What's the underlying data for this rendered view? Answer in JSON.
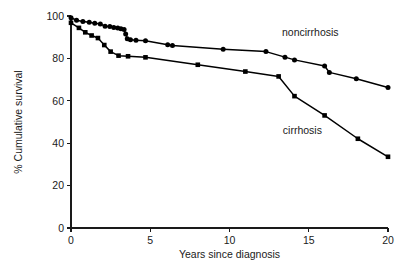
{
  "chart_data": {
    "type": "line",
    "title": "",
    "xlabel": "Years since diagnosis",
    "ylabel": "% Cumulative survival",
    "xlim": [
      0,
      20
    ],
    "ylim": [
      0,
      100
    ],
    "xticks": [
      0,
      5,
      10,
      15,
      20
    ],
    "yticks": [
      0,
      20,
      40,
      60,
      80,
      100
    ],
    "xtick_labels": [
      "0",
      "5",
      "10",
      "15",
      "20"
    ],
    "ytick_labels": [
      "0",
      "20",
      "40",
      "60",
      "80",
      "100"
    ],
    "grid": false,
    "legend_position": "inline-annotations",
    "series": [
      {
        "name": "noncirrhosis",
        "marker": "circle",
        "color": "#000000",
        "label_text": "noncirrhosis",
        "label_x": 15.1,
        "label_y": 90.5,
        "points": [
          {
            "x": 0.0,
            "y": 99.2
          },
          {
            "x": 0.35,
            "y": 98.0
          },
          {
            "x": 0.75,
            "y": 97.4
          },
          {
            "x": 1.15,
            "y": 97.0
          },
          {
            "x": 1.5,
            "y": 96.6
          },
          {
            "x": 1.85,
            "y": 96.2
          },
          {
            "x": 2.15,
            "y": 95.2
          },
          {
            "x": 2.45,
            "y": 95.0
          },
          {
            "x": 2.7,
            "y": 94.6
          },
          {
            "x": 2.95,
            "y": 94.3
          },
          {
            "x": 3.15,
            "y": 94.0
          },
          {
            "x": 3.35,
            "y": 93.6
          },
          {
            "x": 3.45,
            "y": 91.5
          },
          {
            "x": 3.55,
            "y": 89.3
          },
          {
            "x": 3.75,
            "y": 88.8
          },
          {
            "x": 4.1,
            "y": 88.6
          },
          {
            "x": 4.7,
            "y": 88.3
          },
          {
            "x": 6.1,
            "y": 86.4
          },
          {
            "x": 6.4,
            "y": 86.1
          },
          {
            "x": 9.6,
            "y": 84.3
          },
          {
            "x": 12.3,
            "y": 83.2
          },
          {
            "x": 13.5,
            "y": 80.6
          },
          {
            "x": 14.1,
            "y": 79.3
          },
          {
            "x": 16.0,
            "y": 76.4
          },
          {
            "x": 16.3,
            "y": 73.4
          },
          {
            "x": 18.0,
            "y": 70.4
          },
          {
            "x": 20.0,
            "y": 66.3
          }
        ]
      },
      {
        "name": "cirrhosis",
        "marker": "square",
        "color": "#000000",
        "label_text": "cirrhosis",
        "label_x": 14.6,
        "label_y": 44.5,
        "points": [
          {
            "x": 0.0,
            "y": 96.8
          },
          {
            "x": 0.5,
            "y": 94.4
          },
          {
            "x": 0.9,
            "y": 92.3
          },
          {
            "x": 1.3,
            "y": 90.8
          },
          {
            "x": 1.7,
            "y": 89.6
          },
          {
            "x": 2.1,
            "y": 86.3
          },
          {
            "x": 2.5,
            "y": 83.2
          },
          {
            "x": 3.0,
            "y": 81.3
          },
          {
            "x": 3.6,
            "y": 81.0
          },
          {
            "x": 4.7,
            "y": 80.5
          },
          {
            "x": 8.0,
            "y": 77.0
          },
          {
            "x": 11.0,
            "y": 73.8
          },
          {
            "x": 13.1,
            "y": 71.5
          },
          {
            "x": 14.1,
            "y": 62.2
          },
          {
            "x": 16.0,
            "y": 53.1
          },
          {
            "x": 18.1,
            "y": 42.1
          },
          {
            "x": 20.0,
            "y": 33.6
          }
        ]
      }
    ]
  },
  "geometry": {
    "plot_left": 71,
    "plot_right": 388,
    "plot_top": 16,
    "plot_bottom": 228,
    "tick_length": 4,
    "xlabel_y": 258,
    "ylabel_x": 22
  }
}
